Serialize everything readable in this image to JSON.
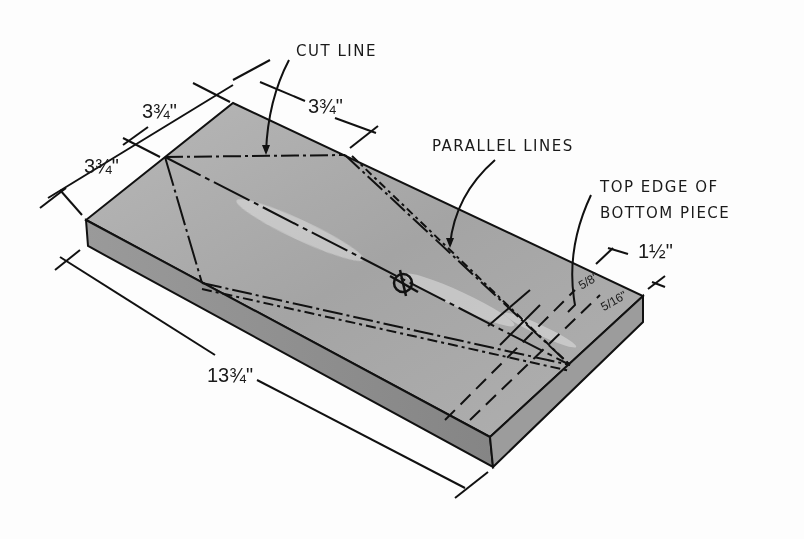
{
  "labels": {
    "cut_line": "CUT LINE",
    "parallel_lines": "PARALLEL LINES",
    "top_edge_line1": "TOP EDGE OF",
    "top_edge_line2": "BOTTOM PIECE"
  },
  "dimensions": {
    "top_left_upper": "3¾\"",
    "top_left_lower": "3¾\"",
    "top_right": "3¾\"",
    "length": "13¾\"",
    "end_width": "1½\"",
    "end_frac_a": "5/8\"",
    "end_frac_b": "5/16\""
  },
  "symbols": {
    "centerline": "centerline-symbol"
  },
  "colors": {
    "board_top": "#a9a9a9",
    "board_front": "#8e8e8e",
    "board_end": "#9a9a9a",
    "ink": "#111111",
    "background": "#fdfdfd"
  }
}
